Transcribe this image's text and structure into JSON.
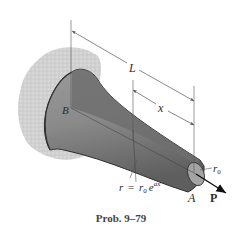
{
  "figure": {
    "caption": "Prob. 9–79",
    "labels": {
      "length": "L",
      "position": "x",
      "fixed_end": "B",
      "free_end": "A",
      "force": "P",
      "end_radius": "r",
      "end_radius_sub": "0",
      "formula_lhs": "r",
      "formula_eq": "=",
      "formula_r": "r",
      "formula_sub": "0",
      "formula_exp_base": "e",
      "formula_exp": "ax"
    },
    "colors": {
      "wall": "#d4d4d4",
      "body_dark": "#6a6a6a",
      "body_mid": "#8c8c8c",
      "body_light": "#a8a8a8",
      "outline": "#2e2e2e",
      "dimension": "#555555"
    }
  }
}
